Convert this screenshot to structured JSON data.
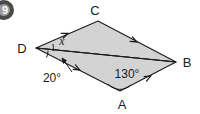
{
  "question_badge": {
    "number": "9",
    "color": "#4a4a4a"
  },
  "figure": {
    "type": "geometry-diagram",
    "shape": "parallelogram",
    "fill_color": "#d3d3d3",
    "stroke_color": "#1b1b1b",
    "background_color": "#ffffff",
    "vertices": [
      {
        "id": "D",
        "label": "D",
        "x": 36,
        "y": 48
      },
      {
        "id": "C",
        "label": "C",
        "x": 98,
        "y": 21
      },
      {
        "id": "B",
        "label": "B",
        "x": 176,
        "y": 62
      },
      {
        "id": "A",
        "label": "A",
        "x": 120,
        "y": 91
      }
    ],
    "diagonal": {
      "from": "D",
      "to": "B"
    },
    "edges": [
      {
        "from": "D",
        "to": "C",
        "marks": 1
      },
      {
        "from": "C",
        "to": "B",
        "marks": 1
      },
      {
        "from": "D",
        "to": "A",
        "marks": 1
      },
      {
        "from": "A",
        "to": "B",
        "marks": 1
      }
    ],
    "angles": [
      {
        "id": "x",
        "label": "x",
        "at_vertex": "D",
        "position": "above-diagonal",
        "is_unknown": true
      },
      {
        "id": "twenty",
        "label": "20°",
        "at_vertex": "D",
        "position": "below-diagonal",
        "has_leader_arrow": true
      },
      {
        "id": "onethirty",
        "label": "130°",
        "at_vertex": "A",
        "position": "interior"
      }
    ]
  },
  "labels": {
    "vertex_c": "C",
    "vertex_d": "D",
    "vertex_b": "B",
    "vertex_a": "A",
    "angle_x": "x",
    "angle_20": "20°",
    "angle_130": "130°"
  }
}
